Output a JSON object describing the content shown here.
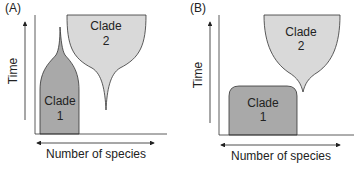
{
  "colors": {
    "clade1": "#a9a9a9",
    "clade2": "#d9d9d9",
    "stroke": "#333333"
  },
  "panels": [
    {
      "label": "(A)",
      "y_axis_label": "Time",
      "x_axis_label": "Number of species",
      "clades": [
        {
          "name_line1": "Clade",
          "name_line2": "1"
        },
        {
          "name_line1": "Clade",
          "name_line2": "2"
        }
      ]
    },
    {
      "label": "(B)",
      "y_axis_label": "Time",
      "x_axis_label": "Number of species",
      "clades": [
        {
          "name_line1": "Clade",
          "name_line2": "1"
        },
        {
          "name_line1": "Clade",
          "name_line2": "2"
        }
      ]
    }
  ]
}
